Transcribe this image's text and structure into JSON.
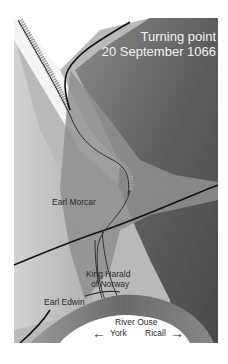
{
  "map": {
    "title_line1": "Turning point",
    "title_line2": "20 September 1066",
    "labels": {
      "earl_morcar": "Earl Morcar",
      "king_harald_line1": "King Harald",
      "king_harald_line2": "of Norway",
      "earl_edwin": "Earl Edwin",
      "river": "River Ouse",
      "york": "York",
      "ricall": "Ricall"
    },
    "icons": {
      "left_arrow": "←",
      "right_arrow": "→"
    },
    "colors": {
      "background": "#ffffff",
      "dark_field": "#5a5a5a",
      "mid_field": "#8c8c8c",
      "light_field": "#c4c4c4",
      "river": "#707070",
      "road": "#111111",
      "title_text": "#f2f2f2",
      "label_text": "#2a2a2a"
    }
  }
}
